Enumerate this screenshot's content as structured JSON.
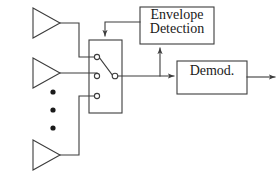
{
  "diagram": {
    "stroke_color": "#3d3d3d",
    "text_color": "#1a1a1a",
    "background": "#ffffff",
    "blocks": [
      {
        "id": "switch",
        "name": "antenna-selection-switch",
        "label": "",
        "x": 89,
        "y": 40,
        "w": 33,
        "h": 73
      },
      {
        "id": "envelope",
        "name": "envelope-detection-block",
        "label_line1": "Envelope",
        "label_line2": "Detection",
        "x": 140,
        "y": 7,
        "w": 74,
        "h": 37
      },
      {
        "id": "demod",
        "name": "demodulator-block",
        "label": "Demod.",
        "x": 177,
        "y": 61,
        "w": 70,
        "h": 33
      }
    ],
    "antennas": [
      {
        "id": "antenna-1",
        "name": "antenna-top",
        "apex_x": 60,
        "apex_y": 23
      },
      {
        "id": "antenna-2",
        "name": "antenna-middle",
        "apex_x": 60,
        "apex_y": 73
      },
      {
        "id": "antenna-3",
        "name": "antenna-bottom",
        "apex_x": 60,
        "apex_y": 155
      }
    ],
    "ellipsis_dots": [
      {
        "x": 53,
        "y": 92
      },
      {
        "x": 53,
        "y": 110
      },
      {
        "x": 53,
        "y": 128
      }
    ],
    "switch_contacts": [
      {
        "id": "contact-1",
        "name": "switch-contact-top",
        "x": 97,
        "y": 57,
        "selected": true
      },
      {
        "id": "contact-2",
        "name": "switch-contact-middle",
        "x": 97,
        "y": 76,
        "selected": false
      },
      {
        "id": "contact-3",
        "name": "switch-contact-bottom",
        "x": 97,
        "y": 96,
        "selected": false
      }
    ],
    "switch_pole": {
      "name": "switch-common-pole",
      "x": 115,
      "y": 76
    },
    "signals": [
      {
        "name": "antenna-1-feed",
        "from": "antenna-top",
        "to": "switch-contact-top"
      },
      {
        "name": "antenna-2-feed",
        "from": "antenna-middle",
        "to": "switch-contact-middle"
      },
      {
        "name": "antenna-3-feed",
        "from": "antenna-bottom",
        "to": "switch-contact-bottom"
      },
      {
        "name": "switch-output-line",
        "from": "switch-common-pole",
        "to": "demodulator-block"
      },
      {
        "name": "envelope-detection-tap",
        "from": "switch-output-line",
        "to": "envelope-detection-block"
      },
      {
        "name": "switch-control-line",
        "from": "envelope-detection-block",
        "to": "antenna-selection-switch"
      },
      {
        "name": "demod-output-line",
        "from": "demodulator-block",
        "to": "output"
      }
    ]
  }
}
